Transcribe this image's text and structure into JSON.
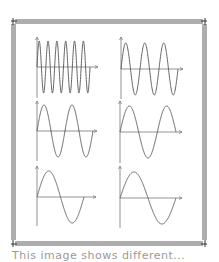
{
  "figure": {
    "border_style": "tick-mark perforated frame",
    "frame_color": "#333333",
    "curve_color": "#555555",
    "axis_color": "#777777"
  },
  "chart_data": [
    {
      "type": "line",
      "panel": "row1-left",
      "function": "sine",
      "cycles": 6,
      "title": "",
      "xlabel": "",
      "ylabel": ""
    },
    {
      "type": "line",
      "panel": "row1-right",
      "function": "sine",
      "cycles": 3,
      "title": "",
      "xlabel": "",
      "ylabel": ""
    },
    {
      "type": "line",
      "panel": "row2-left",
      "function": "sine",
      "cycles": 2,
      "title": "",
      "xlabel": "",
      "ylabel": ""
    },
    {
      "type": "line",
      "panel": "row2-right",
      "function": "sine",
      "cycles": 1.5,
      "title": "",
      "xlabel": "",
      "ylabel": ""
    },
    {
      "type": "line",
      "panel": "row3-left",
      "function": "sine",
      "cycles": 1,
      "title": "",
      "xlabel": "",
      "ylabel": ""
    },
    {
      "type": "line",
      "panel": "row3-right",
      "function": "sine",
      "cycles": 1,
      "title": "",
      "xlabel": "",
      "ylabel": ""
    }
  ],
  "caption": {
    "text": "This image shows different..."
  }
}
